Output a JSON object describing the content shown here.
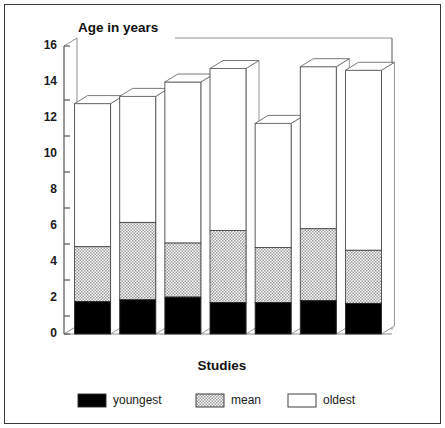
{
  "chart_data": {
    "type": "bar",
    "subtype": "stacked-3d-column",
    "title": "Age in years",
    "xlabel": "Studies",
    "ylabel": "Age in years",
    "ylim": [
      0,
      16
    ],
    "ytick_step": 2,
    "yticks": [
      "0",
      "2",
      "4",
      "6",
      "8",
      "10",
      "12",
      "14",
      "16"
    ],
    "ytick_values": [
      0,
      2,
      4,
      6,
      8,
      10,
      12,
      14,
      16
    ],
    "grid": false,
    "legend_position": "bottom",
    "categories": [
      "1",
      "2",
      "3",
      "4",
      "5",
      "6",
      "7"
    ],
    "xtick_labels_shown": false,
    "series": [
      {
        "name": "youngest",
        "color": "#000000",
        "values": [
          1.8,
          1.9,
          2.05,
          1.75,
          1.75,
          1.85,
          1.7
        ]
      },
      {
        "name": "mean",
        "color": "#c8c8c8",
        "pattern": "halftone-checker",
        "values": [
          4.85,
          6.2,
          5.05,
          5.75,
          4.8,
          5.85,
          4.65
        ]
      },
      {
        "name": "oldest",
        "color": "#ffffff",
        "values": [
          12.8,
          13.2,
          14.0,
          14.75,
          11.7,
          14.85,
          14.65
        ]
      }
    ]
  },
  "legend": {
    "items": [
      {
        "label": "youngest",
        "swatch": "black"
      },
      {
        "label": "mean",
        "swatch": "hatched"
      },
      {
        "label": "oldest",
        "swatch": "white"
      }
    ]
  },
  "colors": {
    "youngest": "#000000",
    "mean": "#c8c8c8",
    "oldest": "#ffffff",
    "outline": "#4a4a4a",
    "frame": "#3a3a3a",
    "axis": "#555555",
    "text": "#111111"
  }
}
